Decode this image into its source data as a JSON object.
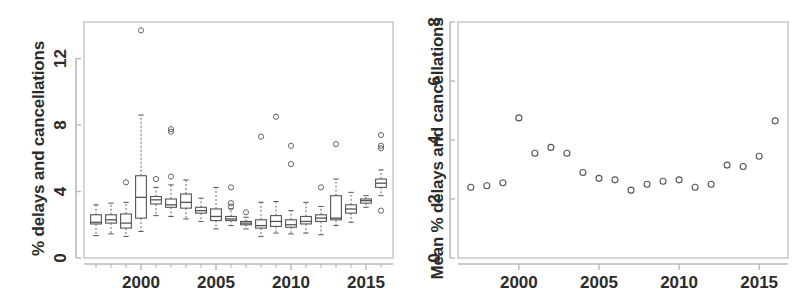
{
  "figure": {
    "background_color": "#ffffff",
    "axis_color": "#b9b9b9",
    "data_color": "#555555",
    "text_color": "#2b2b2b"
  },
  "chart_data": [
    {
      "type": "box",
      "panel": "left",
      "title": "",
      "xlabel": "",
      "ylabel": "% delays and cancellations",
      "xlim": [
        1996.2,
        2016.8
      ],
      "ylim": [
        0,
        14.2
      ],
      "grid": false,
      "legend": null,
      "yticks": [
        0,
        4,
        8,
        12
      ],
      "ytick_labels": [
        "0",
        "4",
        "8",
        "12"
      ],
      "xticks": [
        2000,
        2005,
        2010,
        2015
      ],
      "xtick_labels": [
        "2000",
        "2005",
        "2010",
        "2015"
      ],
      "xtick_minor": [
        1997,
        1998,
        1999,
        2001,
        2002,
        2003,
        2004,
        2006,
        2007,
        2008,
        2009,
        2011,
        2012,
        2013,
        2014,
        2016
      ],
      "categories": [
        1997,
        1998,
        1999,
        2000,
        2001,
        2002,
        2003,
        2004,
        2005,
        2006,
        2007,
        2008,
        2009,
        2010,
        2011,
        2012,
        2013,
        2014,
        2015,
        2016
      ],
      "boxes": [
        {
          "x": 1997,
          "whisker_low": 1.35,
          "q1": 2.05,
          "median": 2.15,
          "q3": 2.6,
          "whisker_high": 3.2,
          "outliers": []
        },
        {
          "x": 1998,
          "whisker_low": 1.45,
          "q1": 2.1,
          "median": 2.3,
          "q3": 2.6,
          "whisker_high": 3.3,
          "outliers": []
        },
        {
          "x": 1999,
          "whisker_low": 1.3,
          "q1": 1.8,
          "median": 2.1,
          "q3": 2.65,
          "whisker_high": 3.35,
          "outliers": [
            4.55
          ]
        },
        {
          "x": 2000,
          "whisker_low": 1.6,
          "q1": 2.4,
          "median": 3.65,
          "q3": 4.95,
          "whisker_high": 8.6,
          "outliers": [
            13.7
          ]
        },
        {
          "x": 2001,
          "whisker_low": 2.55,
          "q1": 3.25,
          "median": 3.5,
          "q3": 3.7,
          "whisker_high": 4.25,
          "outliers": [
            4.75
          ]
        },
        {
          "x": 2002,
          "whisker_low": 2.5,
          "q1": 3.05,
          "median": 3.2,
          "q3": 3.55,
          "whisker_high": 4.4,
          "outliers": [
            7.6,
            7.75,
            4.9
          ]
        },
        {
          "x": 2003,
          "whisker_low": 2.35,
          "q1": 3.0,
          "median": 3.35,
          "q3": 3.85,
          "whisker_high": 4.7,
          "outliers": []
        },
        {
          "x": 2004,
          "whisker_low": 2.2,
          "q1": 2.7,
          "median": 2.85,
          "q3": 3.05,
          "whisker_high": 3.6,
          "outliers": []
        },
        {
          "x": 2005,
          "whisker_low": 1.75,
          "q1": 2.25,
          "median": 2.5,
          "q3": 2.95,
          "whisker_high": 4.25,
          "outliers": []
        },
        {
          "x": 2006,
          "whisker_low": 1.95,
          "q1": 2.25,
          "median": 2.35,
          "q3": 2.5,
          "whisker_high": 2.95,
          "outliers": [
            4.25,
            3.3,
            3.1
          ]
        },
        {
          "x": 2007,
          "whisker_low": 1.75,
          "q1": 2.0,
          "median": 2.1,
          "q3": 2.2,
          "whisker_high": 2.45,
          "outliers": [
            2.75
          ]
        },
        {
          "x": 2008,
          "whisker_low": 1.3,
          "q1": 1.8,
          "median": 1.95,
          "q3": 2.3,
          "whisker_high": 3.35,
          "outliers": [
            7.3
          ]
        },
        {
          "x": 2009,
          "whisker_low": 1.5,
          "q1": 1.9,
          "median": 2.2,
          "q3": 2.55,
          "whisker_high": 3.4,
          "outliers": [
            8.5
          ]
        },
        {
          "x": 2010,
          "whisker_low": 1.45,
          "q1": 1.85,
          "median": 2.0,
          "q3": 2.3,
          "whisker_high": 2.85,
          "outliers": [
            6.75,
            5.65
          ]
        },
        {
          "x": 2011,
          "whisker_low": 1.5,
          "q1": 2.05,
          "median": 2.2,
          "q3": 2.5,
          "whisker_high": 3.35,
          "outliers": []
        },
        {
          "x": 2012,
          "whisker_low": 1.4,
          "q1": 2.2,
          "median": 2.4,
          "q3": 2.6,
          "whisker_high": 3.1,
          "outliers": [
            4.25
          ]
        },
        {
          "x": 2013,
          "whisker_low": 1.95,
          "q1": 2.3,
          "median": 2.4,
          "q3": 3.75,
          "whisker_high": 4.75,
          "outliers": [
            6.85
          ]
        },
        {
          "x": 2014,
          "whisker_low": 2.15,
          "q1": 2.7,
          "median": 2.95,
          "q3": 3.2,
          "whisker_high": 3.95,
          "outliers": []
        },
        {
          "x": 2015,
          "whisker_low": 3.05,
          "q1": 3.3,
          "median": 3.45,
          "q3": 3.55,
          "whisker_high": 3.75,
          "outliers": []
        },
        {
          "x": 2016,
          "whisker_low": 3.75,
          "q1": 4.25,
          "median": 4.5,
          "q3": 4.75,
          "whisker_high": 5.3,
          "outliers": [
            7.4,
            6.75,
            6.6,
            2.85
          ]
        }
      ]
    },
    {
      "type": "scatter",
      "panel": "right",
      "title": "",
      "xlabel": "",
      "ylabel": "Mean % delays and cancellations",
      "xlim": [
        1996.2,
        2016.8
      ],
      "ylim": [
        0,
        8
      ],
      "grid": false,
      "legend": null,
      "yticks": [
        0,
        2,
        4,
        6,
        8
      ],
      "ytick_labels": [
        "0",
        "2",
        "4",
        "6",
        "8"
      ],
      "xticks": [
        2000,
        2005,
        2010,
        2015
      ],
      "xtick_labels": [
        "2000",
        "2005",
        "2010",
        "2015"
      ],
      "marker": "open-circle",
      "x": [
        1997,
        1998,
        1999,
        2000,
        2001,
        2002,
        2003,
        2004,
        2005,
        2006,
        2007,
        2008,
        2009,
        2010,
        2011,
        2012,
        2013,
        2014,
        2015,
        2016
      ],
      "values": [
        2.4,
        2.45,
        2.55,
        4.75,
        3.55,
        3.75,
        3.55,
        2.9,
        2.7,
        2.65,
        2.3,
        2.5,
        2.6,
        2.65,
        2.4,
        2.5,
        3.15,
        3.1,
        3.45,
        4.65
      ]
    }
  ]
}
